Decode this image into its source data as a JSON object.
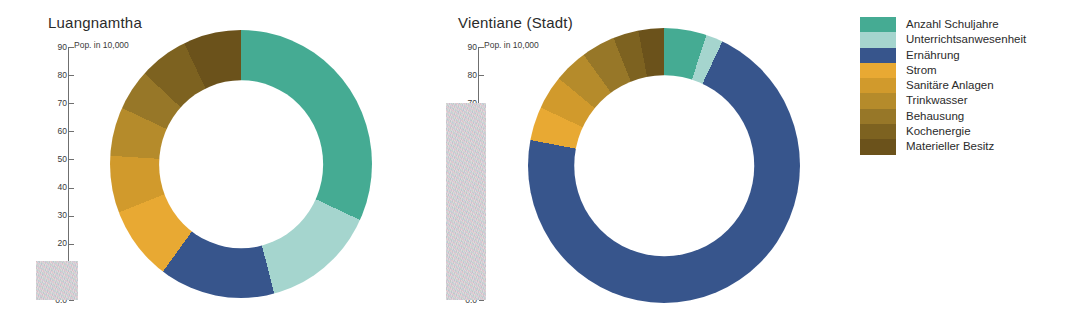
{
  "legend": {
    "items": [
      {
        "label": "Anzahl Schuljahre",
        "color": "#45ab93"
      },
      {
        "label": "Unterrichtsanwesenheit",
        "color": "#a5d5ce"
      },
      {
        "label": "Ernährung",
        "color": "#37558c"
      },
      {
        "label": "Strom",
        "color": "#e8a933"
      },
      {
        "label": "Sanitäre Anlagen",
        "color": "#d19a2c"
      },
      {
        "label": "Trinkwasser",
        "color": "#b58b2b"
      },
      {
        "label": "Behausung",
        "color": "#977728"
      },
      {
        "label": "Kochenergie",
        "color": "#7d6220"
      },
      {
        "label": "Materieller Besitz",
        "color": "#6b521b"
      }
    ]
  },
  "panels": [
    {
      "title": "Luangnamtha",
      "axis": {
        "unit_label": "Pop. in 10,000",
        "ticks": [
          "90",
          "80",
          "70",
          "60",
          "50",
          "40",
          "30",
          "20",
          "10",
          "0.0"
        ],
        "max": 90,
        "min": 0
      },
      "bar": {
        "value": 14
      }
    },
    {
      "title": "Vientiane (Stadt)",
      "axis": {
        "unit_label": "Pop. in 10,000",
        "ticks": [
          "90",
          "80",
          "70",
          "60",
          "50",
          "40",
          "30",
          "20",
          "10",
          "0.0"
        ],
        "max": 90,
        "min": 0
      },
      "bar": {
        "value": 70
      }
    }
  ],
  "chart_data": [
    {
      "type": "pie",
      "title": "Luangnamtha",
      "subtitle": "Pop. in 10,000",
      "variant": "donut",
      "start_angle": 0,
      "direction": "clockwise",
      "labels": [
        "Anzahl Schuljahre",
        "Unterrichtsanwesenheit",
        "Ernährung",
        "Strom",
        "Sanitäre Anlagen",
        "Trinkwasser",
        "Behausung",
        "Kochenergie",
        "Materieller Besitz"
      ],
      "values": [
        32,
        14,
        14,
        9,
        7,
        6,
        5,
        6,
        7
      ],
      "unit": "percent",
      "colors": [
        "#45ab93",
        "#a5d5ce",
        "#37558c",
        "#e8a933",
        "#d19a2c",
        "#b58b2b",
        "#977728",
        "#7d6220",
        "#6b521b"
      ],
      "bar_value": 14,
      "bar_label": "Pop. in 10,000",
      "ylim": [
        0,
        90
      ],
      "grid": false,
      "legend_position": "right"
    },
    {
      "type": "pie",
      "title": "Vientiane (Stadt)",
      "subtitle": "Pop. in 10,000",
      "variant": "donut",
      "start_angle": 0,
      "direction": "clockwise",
      "labels": [
        "Anzahl Schuljahre",
        "Unterrichtsanwesenheit",
        "Ernährung",
        "Strom",
        "Sanitäre Anlagen",
        "Trinkwasser",
        "Behausung",
        "Kochenergie",
        "Materieller Besitz"
      ],
      "values": [
        5,
        2,
        71,
        4,
        4,
        4,
        4,
        3,
        3
      ],
      "unit": "percent",
      "colors": [
        "#45ab93",
        "#a5d5ce",
        "#37558c",
        "#e8a933",
        "#d19a2c",
        "#b58b2b",
        "#977728",
        "#7d6220",
        "#6b521b"
      ],
      "bar_value": 70,
      "bar_label": "Pop. in 10,000",
      "ylim": [
        0,
        90
      ],
      "grid": false,
      "legend_position": "right"
    }
  ]
}
